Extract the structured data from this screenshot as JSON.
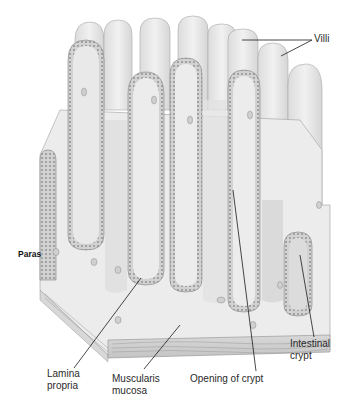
{
  "diagram": {
    "labels": {
      "villi": "Villi",
      "paras": "Paras",
      "lamina_propria": "Lamina\npropria",
      "muscularis_mucosa": "Muscularis\nmucosa",
      "opening_of_crypt": "Opening of crypt",
      "intestinal_crypt": "Intestinal\ncrypt"
    },
    "colors": {
      "tissue": "#ececec",
      "tissue_shade": "#d9d9d9",
      "epithelium": "#bdbdbd",
      "outline": "#8a8a8a",
      "muscle": "#cfcfcf",
      "leader": "#1a1a1a",
      "text": "#2a2a2a"
    }
  }
}
